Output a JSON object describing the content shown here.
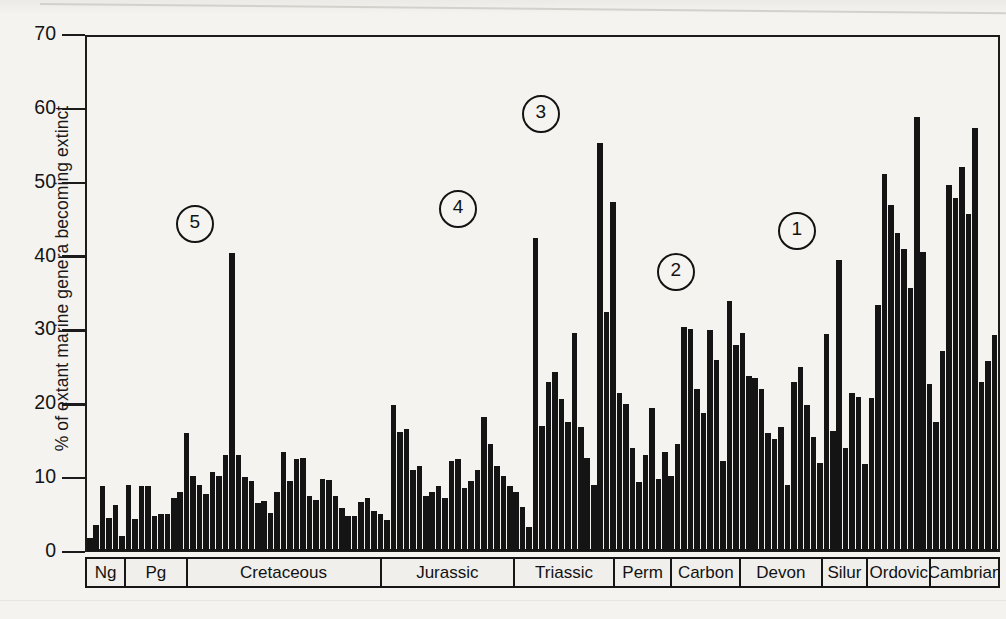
{
  "chart_data": {
    "type": "bar",
    "title": "",
    "xlabel": "",
    "ylabel": "% of extant marine genera becoming extinct",
    "ylim": [
      0,
      70
    ],
    "yticks": [
      0,
      10,
      20,
      30,
      40,
      50,
      60,
      70
    ],
    "grid": false,
    "legend": null,
    "x_axis_kind": "geologic-time (most recent at left, oldest at right)",
    "categories_note": "Each bar is one geologic stage; period bands are labelled along the x-axis",
    "period_bands": [
      {
        "label": "Ng",
        "x_start_pct": 0.0,
        "x_end_pct": 4.4
      },
      {
        "label": "Pg",
        "x_start_pct": 4.4,
        "x_end_pct": 11.1
      },
      {
        "label": "Cretaceous",
        "x_start_pct": 11.1,
        "x_end_pct": 32.3
      },
      {
        "label": "Jurassic",
        "x_start_pct": 32.3,
        "x_end_pct": 46.9
      },
      {
        "label": "Triassic",
        "x_start_pct": 46.9,
        "x_end_pct": 57.8
      },
      {
        "label": "Perm",
        "x_start_pct": 57.8,
        "x_end_pct": 64.1
      },
      {
        "label": "Carbon",
        "x_start_pct": 64.1,
        "x_end_pct": 71.6
      },
      {
        "label": "Devon",
        "x_start_pct": 71.6,
        "x_end_pct": 80.5
      },
      {
        "label": "Silur",
        "x_start_pct": 80.5,
        "x_end_pct": 85.5
      },
      {
        "label": "Ordovic",
        "x_start_pct": 85.5,
        "x_end_pct": 92.4
      },
      {
        "label": "Cambrian",
        "x_start_pct": 92.4,
        "x_end_pct": 100.0
      }
    ],
    "annotations": [
      {
        "label": "5",
        "x_pct": 11.6,
        "value": 40.5,
        "event": "End-Cretaceous mass extinction"
      },
      {
        "label": "4",
        "x_pct": 40.5,
        "value": 42.5,
        "event": "End-Triassic mass extinction"
      },
      {
        "label": "3",
        "x_pct": 49.6,
        "value": 55.5,
        "event": "End-Permian mass extinction"
      },
      {
        "label": "2",
        "x_pct": 64.4,
        "value": 34.0,
        "event": "Late Devonian mass extinction"
      },
      {
        "label": "1",
        "x_pct": 77.7,
        "value": 39.5,
        "event": "End-Ordovician mass extinction"
      }
    ],
    "values": [
      1.8,
      3.5,
      8.8,
      4.5,
      6.2,
      2.0,
      9.0,
      4.3,
      8.8,
      8.8,
      4.8,
      5.0,
      5.0,
      7.2,
      8.0,
      16.0,
      10.2,
      9.0,
      7.8,
      10.8,
      10.2,
      13.0,
      40.5,
      13.0,
      10.0,
      9.5,
      6.5,
      6.8,
      5.2,
      8.0,
      13.5,
      9.5,
      12.5,
      12.7,
      7.5,
      7.0,
      9.8,
      9.6,
      7.5,
      5.8,
      4.8,
      4.8,
      6.6,
      7.2,
      5.5,
      5.0,
      4.2,
      19.9,
      16.2,
      16.6,
      11.0,
      11.5,
      7.5,
      8.0,
      8.8,
      7.2,
      12.2,
      12.5,
      8.5,
      9.5,
      11.0,
      18.2,
      14.5,
      11.5,
      10.2,
      8.8,
      8.0,
      6.0,
      3.2,
      42.5,
      17.0,
      23.0,
      24.3,
      20.7,
      17.5,
      29.6,
      16.8,
      12.6,
      9.0,
      55.5,
      32.5,
      47.5,
      21.5,
      20.0,
      14.0,
      9.4,
      13.0,
      19.5,
      9.8,
      13.5,
      10.2,
      14.6,
      30.5,
      30.2,
      22.0,
      18.8,
      30.0,
      26.0,
      12.2,
      34.0,
      28.0,
      29.6,
      23.8,
      23.5,
      22.0,
      16.0,
      15.2,
      16.8,
      9.0,
      23.0,
      25.0,
      19.8,
      15.5,
      12.0,
      29.5,
      16.3,
      39.5,
      14.0,
      21.5,
      21.0,
      11.8,
      20.8,
      33.5,
      51.2,
      47.0,
      43.2,
      41.0,
      35.8,
      59.0,
      40.7,
      22.7,
      17.5,
      27.2,
      49.8,
      48.0,
      52.2,
      45.8,
      57.5,
      23.0,
      25.8,
      29.4
    ]
  },
  "figure": {
    "tick_labels": [
      "70",
      "60",
      "50",
      "40",
      "30",
      "20",
      "10",
      "0"
    ]
  }
}
